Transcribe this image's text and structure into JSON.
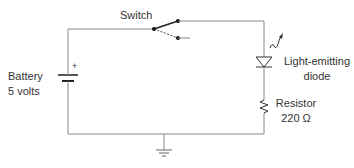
{
  "diagram": {
    "type": "circuit-schematic",
    "components": {
      "switch": {
        "label": "Switch"
      },
      "battery": {
        "label_line1": "Battery",
        "label_line2": "5 volts",
        "polarity": "+"
      },
      "led": {
        "label_line1": "Light-emitting",
        "label_line2": "diode"
      },
      "resistor": {
        "label_line1": "Resistor",
        "label_line2": "220 Ω"
      },
      "ground": {
        "label": ""
      }
    },
    "colors": {
      "wire": "#888888",
      "switch": "#222222",
      "text": "#333333"
    }
  }
}
